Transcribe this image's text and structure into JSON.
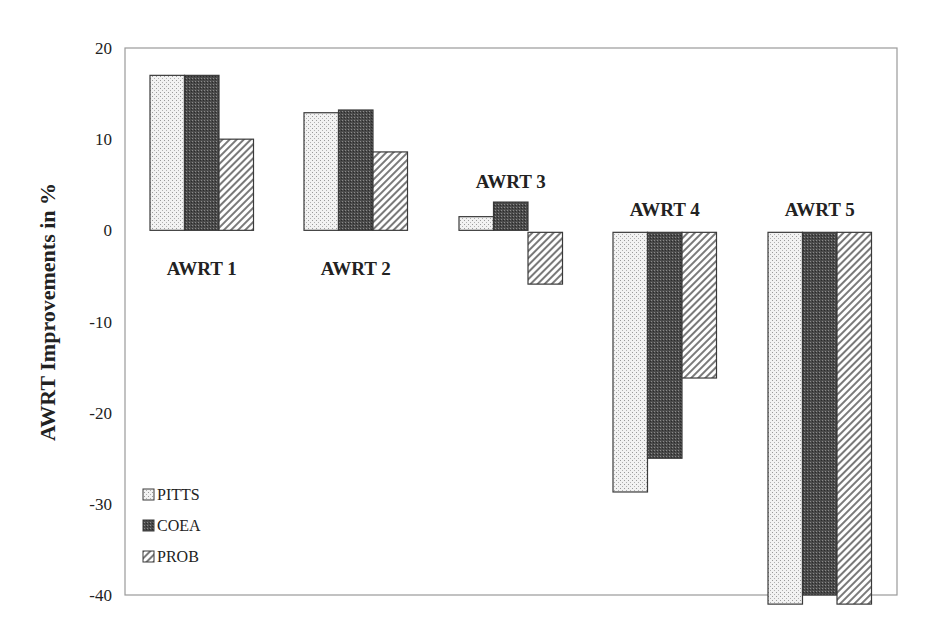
{
  "chart_data": {
    "type": "bar",
    "title": "",
    "xlabel": "",
    "ylabel": "AWRT Improvements in %",
    "ylim": [
      -40,
      20
    ],
    "yticks": [
      20,
      10,
      0,
      -10,
      -20,
      -30,
      -40
    ],
    "grid": false,
    "legend_position": "lower-left inside",
    "categories": [
      "AWRT 1",
      "AWRT 2",
      "AWRT 3",
      "AWRT 4",
      "AWRT 5"
    ],
    "series": [
      {
        "name": "PITTS",
        "pattern": "light-dots",
        "values": [
          17.0,
          12.9,
          1.5,
          -28.7,
          -41.0
        ]
      },
      {
        "name": "COEA",
        "pattern": "dark-dots",
        "values": [
          17.0,
          13.2,
          3.1,
          -25.0,
          -40.0
        ]
      },
      {
        "name": "PROB",
        "pattern": "diagonal-hatch",
        "values": [
          10.0,
          8.6,
          -5.9,
          -16.2,
          -41.0
        ]
      }
    ],
    "label_positions": [
      "below",
      "below",
      "above",
      "above",
      "above"
    ]
  },
  "colors": {
    "axis": "#9a9a9a",
    "bar_outline": "#3a3a3a",
    "pitts_fill": "#ececec",
    "coea_fill": "#555555",
    "prob_fill": "#ffffff",
    "hatch": "#777777"
  }
}
